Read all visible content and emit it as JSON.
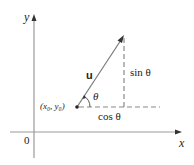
{
  "diagram": {
    "axes": {
      "x_label": "x",
      "y_label": "y",
      "origin_label": "0"
    },
    "vector": {
      "label": "u",
      "start_point_label": "(x₀, y₀)"
    },
    "angle_label": "θ",
    "components": {
      "vertical_label": "sin θ",
      "horizontal_label": "cos θ"
    },
    "colors": {
      "axis": "#9a9a9a",
      "vector": "#7a7a7a",
      "dash": "#8a8a8a",
      "text": "#222222"
    }
  }
}
